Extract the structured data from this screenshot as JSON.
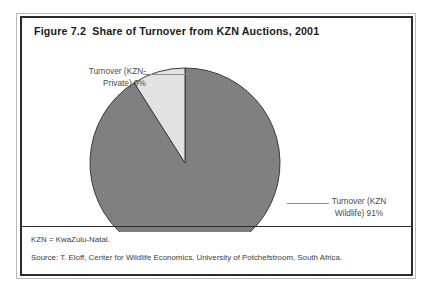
{
  "figure": {
    "title": "Figure 7.2  Share of Turnover from KZN Auctions, 2001",
    "note": "KZN = KwaZulu-Natal.",
    "source": "Source: T. Eloff, Center for Wildlife Economics, University of Potchefstroom, South Africa."
  },
  "labels": {
    "private": "Turnover (KZN-\nPrivate) 9%",
    "wildlife": "Turnover (KZN\nWildlife) 91%"
  },
  "colors": {
    "slice_wildlife": "#808080",
    "slice_private": "#e2e2e2",
    "slice_outline": "#3a3a3a",
    "frame": "#2b2b2b",
    "leader": "#8e8e8e"
  },
  "chart_data": {
    "type": "pie",
    "title": "Figure 7.2  Share of Turnover from KZN Auctions, 2001",
    "categories": [
      "Turnover (KZN Wildlife)",
      "Turnover (KZN-Private)"
    ],
    "values": [
      91,
      9
    ],
    "value_unit": "percent",
    "data_labels": [
      "Turnover (KZN Wildlife) 91%",
      "Turnover (KZN-Private) 9%"
    ],
    "slice_colors": [
      "#808080",
      "#e2e2e2"
    ],
    "start_angle_deg": 90,
    "direction": "counterclockwise",
    "legend": "none",
    "grid": false,
    "xlabel": "",
    "ylabel": "",
    "annotations": [
      "KZN = KwaZulu-Natal.",
      "Source: T. Eloff, Center for Wildlife Economics, University of Potchefstroom, South Africa."
    ]
  }
}
